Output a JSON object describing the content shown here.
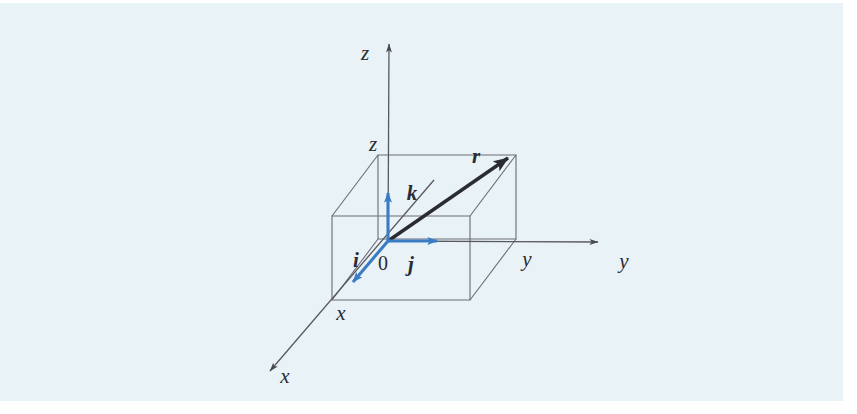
{
  "figure": {
    "type": "geometry-diagram",
    "background_color": "#e8f2f7",
    "page_color": "#ffffff",
    "line_color": "#585860",
    "vector_color": "#2b2b33",
    "basis_vector_color": "#3a7cc4",
    "labels": {
      "z_axis": "z",
      "z_point": "z",
      "y_axis": "y",
      "y_point": "y",
      "x_axis": "x",
      "x_point": "x",
      "origin": "0",
      "i_vector": "i",
      "j_vector": "j",
      "k_vector": "k",
      "r_vector": "r"
    },
    "geometry": {
      "origin": [
        388,
        241
      ],
      "z_axis_tip": [
        389,
        37
      ],
      "y_axis_tip": [
        606,
        242
      ],
      "x_axis_tip": [
        264,
        376
      ],
      "r_tip": [
        516,
        151
      ],
      "box_front_top_left": [
        332,
        216
      ],
      "box_front_bottom_right": [
        470,
        300
      ],
      "box_depth_offset": [
        46,
        -61
      ]
    }
  }
}
